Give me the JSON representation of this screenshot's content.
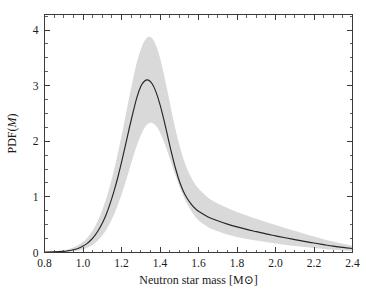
{
  "chart_data": {
    "type": "line",
    "title": "",
    "subtitle": "",
    "xlabel": "Neutron star mass [M⊙]",
    "ylabel": "PDF(M)",
    "ylabel_parts": {
      "prefix": "PDF(",
      "italic": "M",
      "suffix": ")"
    },
    "xlim": [
      0.8,
      2.4
    ],
    "ylim": [
      0.0,
      4.28
    ],
    "grid": false,
    "legend": null,
    "legend_position": "none",
    "xticks": [
      0.8,
      1.0,
      1.2,
      1.4,
      1.6,
      1.8,
      2.0,
      2.2,
      2.4
    ],
    "xtick_labels": [
      "0.8",
      "1.0",
      "1.2",
      "1.4",
      "1.6",
      "1.8",
      "2.0",
      "2.2",
      "2.4"
    ],
    "x_minor_step": 0.05,
    "yticks": [
      0,
      1,
      2,
      3,
      4
    ],
    "ytick_labels": [
      "0",
      "1",
      "2",
      "3",
      "4"
    ],
    "y_minor_step": 0.25,
    "colors": {
      "mean_curve": "#262626",
      "uncertainty_band": "#d9d9d9",
      "axis": "#3a3a3a",
      "background": "#ffffff"
    },
    "series": [
      {
        "name": "PDF(M) median",
        "role": "mean",
        "x": [
          0.8,
          0.85,
          0.9,
          0.92,
          0.94,
          0.96,
          0.98,
          1.0,
          1.02,
          1.04,
          1.06,
          1.08,
          1.1,
          1.12,
          1.14,
          1.16,
          1.18,
          1.2,
          1.22,
          1.24,
          1.26,
          1.28,
          1.3,
          1.32,
          1.34,
          1.36,
          1.38,
          1.4,
          1.42,
          1.44,
          1.46,
          1.48,
          1.5,
          1.52,
          1.54,
          1.56,
          1.58,
          1.6,
          1.65,
          1.7,
          1.75,
          1.8,
          1.85,
          1.9,
          1.95,
          2.0,
          2.05,
          2.1,
          2.15,
          2.2,
          2.25,
          2.3,
          2.35,
          2.4
        ],
        "values": [
          0.005,
          0.01,
          0.02,
          0.028,
          0.04,
          0.058,
          0.082,
          0.115,
          0.16,
          0.22,
          0.3,
          0.4,
          0.525,
          0.68,
          0.87,
          1.09,
          1.34,
          1.62,
          1.92,
          2.23,
          2.52,
          2.79,
          2.985,
          3.085,
          3.1,
          3.03,
          2.88,
          2.66,
          2.39,
          2.09,
          1.79,
          1.52,
          1.29,
          1.11,
          0.98,
          0.88,
          0.8,
          0.74,
          0.64,
          0.57,
          0.51,
          0.46,
          0.415,
          0.375,
          0.335,
          0.3,
          0.265,
          0.232,
          0.2,
          0.17,
          0.142,
          0.115,
          0.092,
          0.072
        ]
      },
      {
        "name": "PDF(M) upper bound",
        "role": "band_upper",
        "x": [
          0.8,
          0.85,
          0.9,
          0.92,
          0.94,
          0.96,
          0.98,
          1.0,
          1.02,
          1.04,
          1.06,
          1.08,
          1.1,
          1.12,
          1.14,
          1.16,
          1.18,
          1.2,
          1.22,
          1.24,
          1.26,
          1.28,
          1.3,
          1.32,
          1.34,
          1.36,
          1.38,
          1.4,
          1.42,
          1.44,
          1.46,
          1.48,
          1.5,
          1.52,
          1.54,
          1.56,
          1.58,
          1.6,
          1.65,
          1.7,
          1.75,
          1.8,
          1.85,
          1.9,
          1.95,
          2.0,
          2.05,
          2.1,
          2.15,
          2.2,
          2.25,
          2.3,
          2.35,
          2.4
        ],
        "values": [
          0.012,
          0.022,
          0.042,
          0.056,
          0.076,
          0.104,
          0.142,
          0.192,
          0.258,
          0.345,
          0.455,
          0.592,
          0.76,
          0.96,
          1.195,
          1.465,
          1.77,
          2.095,
          2.44,
          2.79,
          3.12,
          3.42,
          3.65,
          3.81,
          3.88,
          3.85,
          3.72,
          3.5,
          3.21,
          2.88,
          2.54,
          2.22,
          1.94,
          1.7,
          1.51,
          1.36,
          1.24,
          1.15,
          0.985,
          0.88,
          0.8,
          0.73,
          0.665,
          0.605,
          0.548,
          0.495,
          0.442,
          0.39,
          0.338,
          0.288,
          0.24,
          0.196,
          0.156,
          0.12
        ]
      },
      {
        "name": "PDF(M) lower bound",
        "role": "band_lower",
        "x": [
          0.8,
          0.85,
          0.9,
          0.92,
          0.94,
          0.96,
          0.98,
          1.0,
          1.02,
          1.04,
          1.06,
          1.08,
          1.1,
          1.12,
          1.14,
          1.16,
          1.18,
          1.2,
          1.22,
          1.24,
          1.26,
          1.28,
          1.3,
          1.32,
          1.34,
          1.36,
          1.38,
          1.4,
          1.42,
          1.44,
          1.46,
          1.48,
          1.5,
          1.52,
          1.54,
          1.56,
          1.58,
          1.6,
          1.65,
          1.7,
          1.75,
          1.8,
          1.85,
          1.9,
          1.95,
          2.0,
          2.05,
          2.1,
          2.15,
          2.2,
          2.25,
          2.3,
          2.35,
          2.4
        ],
        "values": [
          0.002,
          0.004,
          0.008,
          0.012,
          0.018,
          0.026,
          0.038,
          0.055,
          0.08,
          0.115,
          0.162,
          0.225,
          0.305,
          0.405,
          0.528,
          0.675,
          0.845,
          1.04,
          1.255,
          1.485,
          1.715,
          1.93,
          2.11,
          2.245,
          2.32,
          2.33,
          2.275,
          2.16,
          2.0,
          1.805,
          1.595,
          1.39,
          1.195,
          1.025,
          0.88,
          0.76,
          0.66,
          0.58,
          0.455,
          0.38,
          0.325,
          0.28,
          0.245,
          0.215,
          0.188,
          0.163,
          0.14,
          0.118,
          0.098,
          0.08,
          0.064,
          0.05,
          0.038,
          0.028
        ]
      }
    ],
    "annotations": [
      {
        "text": "peak",
        "x": 1.34,
        "y": 3.1,
        "visible": false
      }
    ]
  }
}
